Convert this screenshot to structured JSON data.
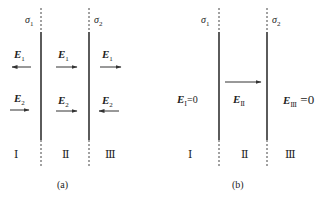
{
  "panels": [
    {
      "caption": "(a)",
      "sheets": [
        {
          "label": "σ",
          "sub": "1"
        },
        {
          "label": "σ",
          "sub": "2"
        }
      ],
      "regions": [
        "Ⅰ",
        "Ⅱ",
        "Ⅲ"
      ],
      "fields": {
        "E1": {
          "label": "E",
          "sub": "1",
          "directions": [
            "left",
            "right",
            "right"
          ]
        },
        "E2": {
          "label": "E",
          "sub": "2",
          "directions": [
            "right",
            "right",
            "left"
          ]
        }
      }
    },
    {
      "caption": "(b)",
      "sheets": [
        {
          "label": "σ",
          "sub": "1"
        },
        {
          "label": "σ",
          "sub": "2"
        }
      ],
      "regions": [
        "Ⅰ",
        "Ⅱ",
        "Ⅲ"
      ],
      "fields": {
        "regionI": {
          "label": "E",
          "sub": "Ⅰ",
          "value": "=0"
        },
        "regionII": {
          "label": "E",
          "sub": "Ⅱ",
          "direction": "right"
        },
        "regionIII": {
          "label": "E",
          "sub": "Ⅲ",
          "value": " =0"
        }
      }
    }
  ],
  "colors": {
    "line": "#333333",
    "arrow": "#333333",
    "text": "#222222"
  }
}
